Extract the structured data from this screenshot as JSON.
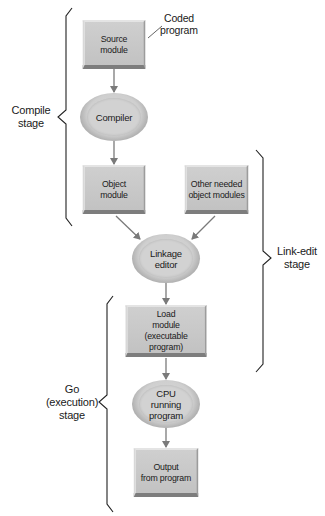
{
  "diagram": {
    "type": "flowchart",
    "nodes": {
      "source_module": {
        "line1": "Source",
        "line2": "module",
        "shape": "rectangle"
      },
      "compiler": {
        "line1": "Compiler",
        "shape": "ellipse"
      },
      "object_module": {
        "line1": "Object",
        "line2": "module",
        "shape": "rectangle"
      },
      "other_modules": {
        "line1": "Other needed",
        "line2": "object modules",
        "shape": "rectangle"
      },
      "linkage_editor": {
        "line1": "Linkage",
        "line2": "editor",
        "shape": "ellipse"
      },
      "load_module": {
        "line1": "Load",
        "line2": "module",
        "line3": "(executable program)",
        "shape": "rectangle"
      },
      "cpu": {
        "line1": "CPU",
        "line2": "running",
        "line3": "program",
        "shape": "ellipse"
      },
      "output": {
        "line1": "Output",
        "line2": "from program",
        "shape": "rectangle"
      }
    },
    "callout": {
      "line1": "Coded",
      "line2": "program",
      "target": "source_module"
    },
    "stages": {
      "compile": {
        "line1": "Compile",
        "line2": "stage"
      },
      "link_edit": {
        "line1": "Link-edit",
        "line2": "stage"
      },
      "go": {
        "line1": "Go",
        "line2": "(execution)",
        "line3": "stage"
      }
    },
    "edges": [
      {
        "from": "source_module",
        "to": "compiler"
      },
      {
        "from": "compiler",
        "to": "object_module"
      },
      {
        "from": "object_module",
        "to": "linkage_editor"
      },
      {
        "from": "other_modules",
        "to": "linkage_editor"
      },
      {
        "from": "linkage_editor",
        "to": "load_module"
      },
      {
        "from": "load_module",
        "to": "cpu"
      },
      {
        "from": "cpu",
        "to": "output"
      }
    ],
    "colors": {
      "node_fill": "#c8c8c8",
      "ellipse_ring": "#a5a5a5",
      "arrow": "#7a7a7a",
      "brace": "#222222"
    }
  }
}
